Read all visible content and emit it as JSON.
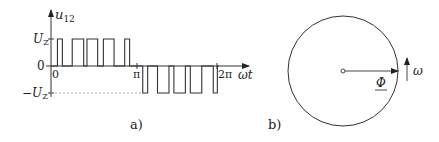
{
  "panel_a": {
    "caption": "a)",
    "y_axis_label": "u",
    "y_axis_label_sub": "12",
    "x_axis_label": "ωt",
    "level_labels": {
      "positive": "U",
      "positive_sub": "Z",
      "zero": "0",
      "negative": "−U",
      "negative_sub": "Z"
    },
    "x_ticks": [
      {
        "label": "0",
        "angle_rad_over_pi": 0
      },
      {
        "label": "π",
        "angle_rad_over_pi": 1
      },
      {
        "label": "2π",
        "angle_rad_over_pi": 2
      }
    ],
    "waveform": {
      "description": "PWM pulse train: positive pulses in first half-cycle, negative pulses in second half-cycle",
      "positive_pulses_fraction_of_pi": [
        [
          0.03,
          0.09
        ],
        [
          0.21,
          0.35
        ],
        [
          0.39,
          0.52
        ],
        [
          0.59,
          0.72
        ],
        [
          0.85,
          0.91
        ]
      ],
      "negative_pulses_fraction_of_pi": [
        [
          1.07,
          1.13
        ],
        [
          1.25,
          1.39
        ],
        [
          1.45,
          1.59
        ],
        [
          1.65,
          1.79
        ],
        [
          1.93,
          1.98
        ]
      ]
    }
  },
  "panel_b": {
    "caption": "b)",
    "vector_label": "Φ",
    "rotation_label": "ω"
  },
  "colors": {
    "stroke": "#333333",
    "dashed": "#888888",
    "text": "#222222"
  }
}
